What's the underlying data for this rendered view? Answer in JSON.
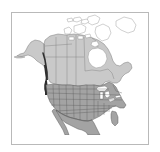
{
  "figure": {
    "type": "reference map",
    "frame_color": "#b9b9b9",
    "background_color": "#ffffff"
  },
  "map": {
    "projection_note": "polar-ish conic, North America centered",
    "ocean_color": "#ffffff",
    "regions": [
      {
        "id": "canada",
        "name": "Canada",
        "fill": "#c9c9c9",
        "stroke": "#6f6f6f",
        "subdivisions_visible": true,
        "subdivision_label": "provinces and territories"
      },
      {
        "id": "alaska",
        "name": "Alaska",
        "fill": "#c9c9c9",
        "stroke": "#6f6f6f",
        "subdivisions_visible": false
      },
      {
        "id": "united-states",
        "name": "United States",
        "fill": "#a3a3a3",
        "stroke": "#5a5a5a",
        "subdivisions_visible": true,
        "subdivision_label": "states"
      },
      {
        "id": "mexico",
        "name": "Mexico",
        "fill": "#a3a3a3",
        "stroke": "#5a5a5a",
        "subdivisions_visible": false
      },
      {
        "id": "arctic-archipelago",
        "name": "Canadian Arctic Archipelago",
        "fill": "#ffffff",
        "stroke": "#8a8a8a",
        "subdivisions_visible": false
      },
      {
        "id": "greenland-edge",
        "name": "Greenland",
        "fill": "#ffffff",
        "stroke": "#8a8a8a",
        "subdivisions_visible": false
      }
    ],
    "highlight": {
      "id": "pacific-coast-highlight",
      "name": "Pacific Northwest coastal strip",
      "color": "#2e2e2e",
      "description": "dark highlighted coastline along the Alaska panhandle and British Columbia coast"
    },
    "water_bodies": [
      {
        "id": "hudson-bay",
        "name": "Hudson Bay",
        "fill": "#ffffff"
      },
      {
        "id": "great-lakes",
        "name": "Great Lakes",
        "fill": "#ffffff"
      }
    ],
    "clipped_bottom": true
  }
}
